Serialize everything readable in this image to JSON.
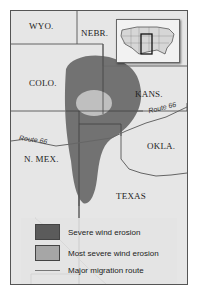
{
  "map": {
    "states": [
      {
        "name": "WYO.",
        "x": 18,
        "y": 10
      },
      {
        "name": "NEBR.",
        "x": 70,
        "y": 17
      },
      {
        "name": "COLO.",
        "x": 18,
        "y": 67
      },
      {
        "name": "KANS.",
        "x": 124,
        "y": 78
      },
      {
        "name": "OKLA.",
        "x": 136,
        "y": 130
      },
      {
        "name": "N. MEX.",
        "x": 13,
        "y": 143
      },
      {
        "name": "TEXAS",
        "x": 105,
        "y": 180
      }
    ],
    "routes": [
      {
        "label": "Route 66",
        "x": 8,
        "y": 128,
        "rotate": 8
      },
      {
        "label": "Route 66",
        "x": 137,
        "y": 96,
        "rotate": -14
      }
    ]
  },
  "legend": {
    "items": [
      {
        "label": "Severe wind erosion",
        "color": "#5b5b5b",
        "type": "swatch"
      },
      {
        "label": "Most severe wind erosion",
        "color": "#a6a6a6",
        "type": "swatch"
      },
      {
        "label": "Major migration route",
        "color": "#777777",
        "type": "line"
      }
    ]
  },
  "colors": {
    "land": "#e6e6e6",
    "severe": "#6a6a6a",
    "most_severe": "#bdbdbd",
    "border": "#555555",
    "route": "#666666"
  }
}
